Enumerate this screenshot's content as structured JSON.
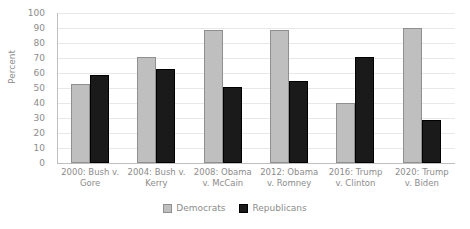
{
  "chart_data": {
    "type": "bar",
    "title": "",
    "subtitle": "",
    "xlabel": "",
    "ylabel": "Percent",
    "ylim": [
      0,
      100
    ],
    "ytick_step": 10,
    "yticks": [
      100,
      90,
      80,
      70,
      60,
      50,
      40,
      30,
      20,
      10,
      0
    ],
    "grid": true,
    "legend_position": "bottom-center",
    "categories": [
      "2000: Bush v. Gore",
      "2004: Bush v. Kerry",
      "2008: Obama v. McCain",
      "2012: Obama v. Romney",
      "2016: Trump v. Clinton",
      "2020: Trump v. Biden"
    ],
    "series": [
      {
        "name": "Democrats",
        "color": "#bfbfbf",
        "values": [
          53,
          71,
          89,
          89,
          40,
          90
        ]
      },
      {
        "name": "Republicans",
        "color": "#1a1a1a",
        "values": [
          59,
          63,
          51,
          55,
          71,
          29
        ]
      }
    ]
  },
  "legend": {
    "items": [
      {
        "label": "Democrats",
        "swatch": "dem"
      },
      {
        "label": "Republicans",
        "swatch": "rep"
      }
    ]
  },
  "colors": {
    "democrats": "#bfbfbf",
    "republicans": "#1a1a1a",
    "gridline": "#e8e8e8",
    "axis": "#bfbfbf",
    "text": "#8c8c8c",
    "background": "#ffffff"
  }
}
